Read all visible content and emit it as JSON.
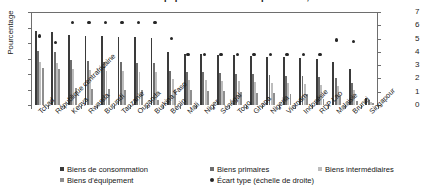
{
  "chart_data": {
    "type": "bar",
    "title": "Part des biens d'équipement dans les importations, 2013",
    "ylabel": "Pourcentage",
    "ylabel_right": "",
    "xlabel": "",
    "ylim": [
      0,
      30
    ],
    "ylim_right": [
      0,
      7
    ],
    "yticks": [
      0,
      5,
      10,
      15,
      20,
      25,
      30
    ],
    "yticks_right": [
      0,
      1,
      2,
      3,
      4,
      5,
      6,
      7
    ],
    "grid": false,
    "legend_position": "bottom",
    "categories": [
      "Tchad",
      "République centrafricaine",
      "Kenya",
      "Rwanda",
      "Burundi",
      "Tanzanie",
      "Ouganda",
      "Burkina Faso",
      "Bénin",
      "Mali",
      "Niger",
      "Sénégal",
      "Togo",
      "Ghana",
      "Nigeria",
      "Vietnam",
      "Indonésie",
      "RDP Lao",
      "Malaisie",
      "Brunei",
      "Singapour"
    ],
    "series": [
      {
        "name": "Biens de consommation",
        "color": "#3a3a3a",
        "axis": "left",
        "values": [
          24.0,
          23.7,
          22.5,
          22.3,
          22.2,
          22.0,
          21.8,
          21.6,
          17.0,
          16.6,
          16.4,
          16.2,
          16.0,
          15.8,
          15.6,
          15.4,
          15.2,
          15.0,
          14.0,
          11.5,
          2.4
        ]
      },
      {
        "name": "Biens primaires",
        "color": "#6d6d6d",
        "axis": "left",
        "values": [
          17.5,
          17.0,
          14.5,
          14.2,
          14.0,
          13.8,
          13.6,
          13.4,
          11.0,
          10.7,
          10.5,
          10.3,
          10.1,
          9.9,
          9.7,
          9.5,
          9.3,
          9.1,
          8.6,
          7.0,
          1.6
        ]
      },
      {
        "name": "Biens intermédiaires",
        "color": "#bdbdbd",
        "axis": "left",
        "values": [
          14.0,
          13.5,
          11.5,
          11.3,
          11.1,
          10.9,
          10.7,
          10.5,
          8.5,
          8.2,
          8.0,
          7.8,
          7.6,
          7.4,
          7.2,
          7.0,
          6.8,
          6.6,
          6.2,
          5.0,
          1.1
        ]
      },
      {
        "name": "Biens d'équipement",
        "color": "#8f8f8f",
        "axis": "left",
        "values": [
          12.0,
          11.5,
          5.5,
          5.3,
          5.1,
          4.9,
          4.7,
          1.5,
          5.0,
          4.8,
          4.6,
          4.4,
          4.2,
          4.0,
          3.8,
          3.6,
          3.4,
          1.8,
          3.0,
          1.2,
          0.5
        ]
      },
      {
        "name": "Écart type (échelle de droite)",
        "color": "#262626",
        "axis": "right",
        "marker": "circle",
        "values": [
          5.2,
          4.7,
          6.2,
          6.2,
          6.2,
          6.2,
          6.2,
          6.2,
          5.0,
          3.8,
          3.8,
          3.8,
          3.8,
          3.8,
          3.8,
          3.8,
          3.8,
          3.8,
          4.9,
          4.8,
          0.0
        ]
      }
    ]
  },
  "legend": {
    "items": [
      {
        "label": "Biens de consommation",
        "marker": "square"
      },
      {
        "label": "Biens primaires",
        "marker": "square"
      },
      {
        "label": "Biens intermédiaires",
        "marker": "square"
      },
      {
        "label": "Biens d'équipement",
        "marker": "square"
      },
      {
        "label": "Écart type (échelle de droite)",
        "marker": "circle"
      }
    ]
  }
}
